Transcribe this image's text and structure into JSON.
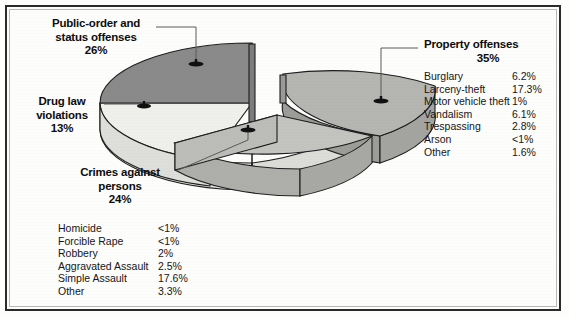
{
  "chart_data": {
    "type": "pie",
    "title": "",
    "subtitle": "",
    "xlabel": "",
    "ylabel": "",
    "legend_position": "callout-labels",
    "grid": false,
    "exploded": true,
    "three_d": true,
    "categories": [
      "Public-order and status offenses",
      "Drug law violations",
      "Crimes against persons",
      "Property offenses"
    ],
    "values": [
      26,
      13,
      24,
      35
    ],
    "value_labels": [
      "26%",
      "13%",
      "24%",
      "35%"
    ],
    "colors": [
      "#8a8a8a",
      "#efefec",
      "#c3c3c0",
      "#b5b5b2"
    ],
    "slices": [
      {
        "label": "Public-order and status offenses",
        "value": 26,
        "value_label": "26%",
        "color": "#8a8a8a"
      },
      {
        "label": "Drug law violations",
        "value": 13,
        "value_label": "13%",
        "color": "#efefec"
      },
      {
        "label": "Crimes against persons",
        "value": 24,
        "value_label": "24%",
        "color": "#c3c3c0"
      },
      {
        "label": "Property offenses",
        "value": 35,
        "value_label": "35%",
        "color": "#b5b5b2"
      }
    ],
    "breakdowns": [
      {
        "parent": "Property offenses",
        "items": [
          {
            "name": "Burglary",
            "value": "6.2%"
          },
          {
            "name": "Larceny-theft",
            "value": "17.3%"
          },
          {
            "name": "Motor vehicle theft",
            "value": "1%"
          },
          {
            "name": "Vandalism",
            "value": "6.1%"
          },
          {
            "name": "Trespassing",
            "value": "2.8%"
          },
          {
            "name": "Arson",
            "value": "<1%"
          },
          {
            "name": "Other",
            "value": "1.6%"
          }
        ]
      },
      {
        "parent": "Crimes against persons",
        "items": [
          {
            "name": "Homicide",
            "value": "<1%"
          },
          {
            "name": "Forcible Rape",
            "value": "<1%"
          },
          {
            "name": "Robbery",
            "value": "2%"
          },
          {
            "name": "Aggravated Assault",
            "value": "2.5%"
          },
          {
            "name": "Simple Assault",
            "value": "17.6%"
          },
          {
            "name": "Other",
            "value": "3.3%"
          }
        ]
      }
    ]
  },
  "callouts": {
    "public_order": {
      "line1": "Public-order and",
      "line2": "status offenses",
      "pct": "26%"
    },
    "drug_law": {
      "line1": "Drug law",
      "line2": "violations",
      "pct": "13%"
    },
    "persons": {
      "line1": "Crimes against",
      "line2": "persons",
      "pct": "24%"
    },
    "property": {
      "line1": "Property offenses",
      "pct": "35%"
    }
  }
}
